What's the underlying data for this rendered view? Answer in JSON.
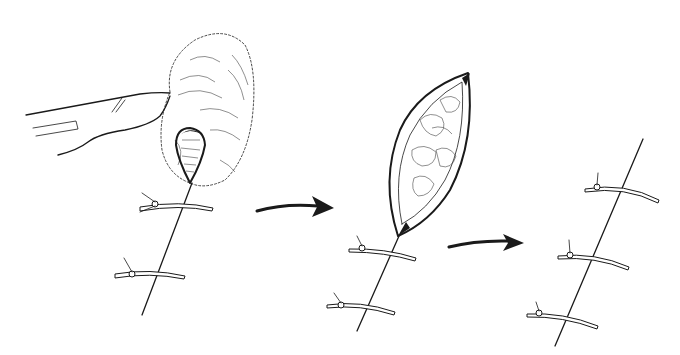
{
  "figure": {
    "type": "medical illustration",
    "background": "#ffffff",
    "ink_color": "#1a1a1a",
    "panels": [
      {
        "id": "panel-1",
        "description": "scalpel retracting skin; ellipse incision opening with two interrupted sutures below",
        "suture_count": 2
      },
      {
        "id": "panel-2",
        "description": "open elliptical wound exposing subcutaneous fat; two interrupted sutures below apex",
        "suture_count": 2
      },
      {
        "id": "panel-3",
        "description": "closed linear incision with three interrupted sutures",
        "suture_count": 3
      }
    ],
    "arrows": [
      {
        "id": "arrow-1",
        "from": "panel-1",
        "to": "panel-2"
      },
      {
        "id": "arrow-2",
        "from": "panel-2",
        "to": "panel-3"
      }
    ]
  }
}
